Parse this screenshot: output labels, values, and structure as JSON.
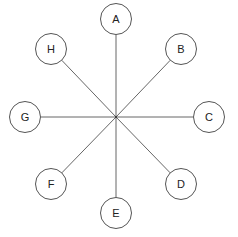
{
  "diagram": {
    "type": "star",
    "center": {
      "x": 116,
      "y": 117
    },
    "radius": 15.5,
    "colors": {
      "stroke": "#555555",
      "fill": "#ffffff",
      "text": "#222222"
    },
    "nodes": [
      {
        "id": "A",
        "label": "A",
        "x": 116,
        "y": 19
      },
      {
        "id": "B",
        "label": "B",
        "x": 181,
        "y": 49
      },
      {
        "id": "C",
        "label": "C",
        "x": 209,
        "y": 117
      },
      {
        "id": "D",
        "label": "D",
        "x": 181,
        "y": 184
      },
      {
        "id": "E",
        "label": "E",
        "x": 116,
        "y": 213
      },
      {
        "id": "F",
        "label": "F",
        "x": 51,
        "y": 184
      },
      {
        "id": "G",
        "label": "G",
        "x": 25,
        "y": 117
      },
      {
        "id": "H",
        "label": "H",
        "x": 51,
        "y": 49
      }
    ]
  }
}
